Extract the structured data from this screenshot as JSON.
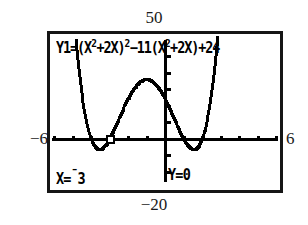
{
  "device": {
    "type": "graphing-calculator-screen"
  },
  "equation": {
    "prefix": "Y1=(X",
    "full_text": "Y1=(X2+2X)2-11(X2+2X)+24",
    "display_parts": [
      {
        "text": "Y1=(X"
      },
      {
        "sup": "2"
      },
      {
        "text": "+2X)"
      },
      {
        "sup": "2"
      },
      {
        "text": "−11(X"
      },
      {
        "sup": "2"
      },
      {
        "text": "+2X)+24"
      }
    ]
  },
  "trace": {
    "x_label": "X=",
    "x_sign": "¯",
    "x_value": "3",
    "x_text": "X=-3",
    "y_label": "Y=",
    "y_value": "0",
    "y_text": "Y=0"
  },
  "window": {
    "ymax_label": "50",
    "ymin_label": "−20",
    "xmin_label": "−6",
    "xmax_label": "6",
    "xmin": -6,
    "xmax": 6,
    "ymin": -20,
    "ymax": 50,
    "xscl": 1,
    "yscl": 10
  },
  "colors": {
    "ink": "#000000",
    "frame": "#151515",
    "label": "#1a1a1a",
    "background": "#ffffff"
  },
  "chart_data": {
    "type": "line",
    "xlabel": "",
    "ylabel": "",
    "xlim": [
      -6,
      6
    ],
    "ylim": [
      -20,
      50
    ],
    "grid": false,
    "legend": "none",
    "annotations": [
      {
        "text": "X=-3",
        "position": "bottom-left"
      },
      {
        "text": "Y=0",
        "position": "bottom-center"
      }
    ],
    "cursor": {
      "x": -3,
      "y": 0,
      "marker": "square-box"
    },
    "roots": [
      -4,
      -3,
      1,
      2
    ],
    "axis_ticks": {
      "x": [
        -6,
        -5,
        -4,
        -3,
        -2,
        -1,
        0,
        1,
        2,
        3,
        4,
        5,
        6
      ],
      "y": [
        -20,
        -10,
        0,
        10,
        20,
        30,
        40,
        50
      ]
    },
    "series": [
      {
        "name": "Y1",
        "expression": "(x^2+2x)^2-11(x^2+2x)+24",
        "x": [
          -6.0,
          -5.8,
          -5.6,
          -5.4,
          -5.2,
          -5.0,
          -4.8,
          -4.6,
          -4.4,
          -4.2,
          -4.0,
          -3.8,
          -3.6,
          -3.4,
          -3.2,
          -3.0,
          -2.8,
          -2.6,
          -2.4,
          -2.2,
          -2.0,
          -1.8,
          -1.6,
          -1.4,
          -1.2,
          -1.0,
          -0.8,
          -0.6,
          -0.4,
          -0.2,
          0.0,
          0.2,
          0.4,
          0.6,
          0.8,
          1.0,
          1.2,
          1.4,
          1.6,
          1.8,
          2.0,
          2.2,
          2.4,
          2.6,
          2.8,
          3.0,
          3.2,
          3.4,
          3.6,
          3.8,
          4.0
        ],
        "y": [
          360.0,
          259.6,
          175.2,
          106.2,
          52.1,
          12.0,
          -15.0,
          -30.0,
          -35.4,
          -33.6,
          -27.0,
          -17.9,
          -8.4,
          0.3,
          7.0,
          11.3,
          13.1,
          12.8,
          11.0,
          8.4,
          6.0,
          4.2,
          3.2,
          3.1,
          3.5,
          4.0,
          4.2,
          4.0,
          3.2,
          1.9,
          0.0,
          -2.4,
          -5.2,
          -8.2,
          -11.2,
          -14.0,
          -16.3,
          -17.8,
          -18.1,
          -16.8,
          -13.0,
          -6.1,
          4.9,
          21.2,
          44.2,
          75.0,
          115.3,
          166.9,
          232.0,
          313.0,
          412.0
        ]
      }
    ]
  }
}
